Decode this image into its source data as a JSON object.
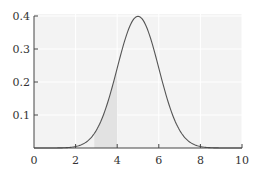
{
  "chart_data": {
    "type": "area",
    "title": "",
    "xlabel": "",
    "ylabel": "",
    "xlim": [
      0,
      10
    ],
    "ylim": [
      0,
      0.4
    ],
    "xticks": [
      0,
      2,
      4,
      6,
      8,
      10
    ],
    "xtick_labels": [
      "0",
      "2",
      "4",
      "6",
      "8",
      "10"
    ],
    "yticks": [
      0.1,
      0.2,
      0.3,
      0.4
    ],
    "ytick_labels": [
      "0.1",
      "0.2",
      "0.3",
      "0.4"
    ],
    "grid": true,
    "series": [
      {
        "name": "normal density",
        "distribution": "normal",
        "mean": 5,
        "sd": 1,
        "x": [
          0,
          0.5,
          1,
          1.5,
          2,
          2.5,
          3,
          3.5,
          4,
          4.5,
          5,
          5.5,
          6,
          6.5,
          7,
          7.5,
          8,
          8.5,
          9,
          9.5,
          10
        ],
        "y": [
          1.5e-06,
          1.6e-05,
          0.000134,
          0.000873,
          0.00443,
          0.0175,
          0.054,
          0.1295,
          0.242,
          0.3521,
          0.3989,
          0.3521,
          0.242,
          0.1295,
          0.054,
          0.0175,
          0.00443,
          0.000873,
          0.000134,
          1.6e-05,
          1.5e-06
        ]
      }
    ],
    "shaded_region": {
      "x_from": 2.9,
      "x_to": 4
    },
    "colors": {
      "plot_background": "#f3f3f3",
      "curve": "#555555",
      "shade": "#e2e2e2",
      "axis": "#444444"
    }
  }
}
